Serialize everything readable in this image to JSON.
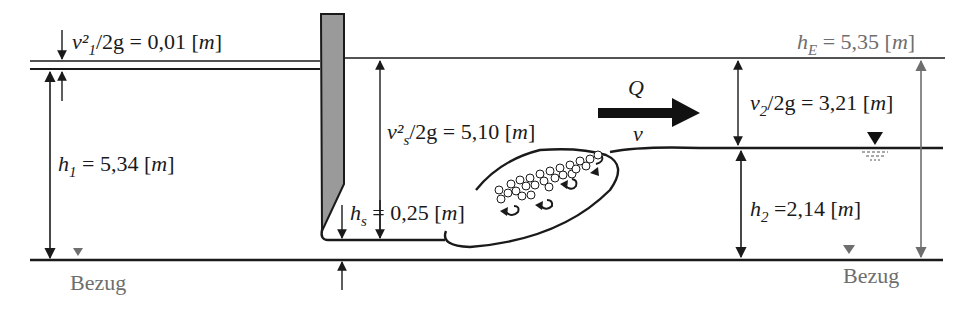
{
  "diagram": {
    "type": "hydraulic-jump-under-sluice-gate",
    "colors": {
      "line": "#1a1a1a",
      "gray": "#6e6e6e",
      "gate_fill": "#9a9a9a",
      "background": "#ffffff"
    },
    "upstream": {
      "velocity_head": {
        "symbol": "v²₁/2g",
        "value": "0,01",
        "unit": "m"
      },
      "depth": {
        "symbol": "h₁",
        "value": "5,34",
        "unit": "m"
      },
      "datum_label": "Bezug"
    },
    "gate": {
      "jet_velocity_head": {
        "symbol": "v²ₛ/2g",
        "value": "5,10",
        "unit": "m"
      },
      "jet_depth": {
        "symbol": "hₛ",
        "value": "0,25",
        "unit": "m"
      }
    },
    "flow": {
      "discharge_symbol": "Q",
      "velocity_symbol": "v"
    },
    "downstream": {
      "energy_head": {
        "symbol": "h_E",
        "value": "5,35",
        "unit": "m"
      },
      "velocity_head": {
        "symbol": "v₂/2g",
        "value": "3,21",
        "unit": "m"
      },
      "depth": {
        "symbol": "h₂",
        "value": "2,14",
        "unit": "m"
      },
      "datum_label": "Bezug"
    },
    "labels": {
      "v1": {
        "main": "v²",
        "sub": "1",
        "rest": "/2g = 0,01 [",
        "unit": "m",
        "close": "]"
      },
      "h1": {
        "main": "h",
        "sub": "1",
        "rest": " = 5,34 [",
        "unit": "m",
        "close": "]"
      },
      "vs": {
        "main": "v²",
        "sub": "s",
        "rest": "/2g = 5,10 [",
        "unit": "m",
        "close": "]"
      },
      "hs": {
        "main": "h",
        "sub": "s",
        "rest": " = 0,25 [",
        "unit": "m",
        "close": "]"
      },
      "hE": {
        "main": "h",
        "sub": "E",
        "rest": " = 5,35 [",
        "unit": "m",
        "close": "]"
      },
      "v2": {
        "main": "v",
        "sub": "2",
        "rest": "/2g = 3,21 [",
        "unit": "m",
        "close": "]"
      },
      "h2": {
        "main": "h",
        "sub": "2",
        "rest": " =2,14 [",
        "unit": "m",
        "close": "]"
      },
      "Q": "Q",
      "v": "v",
      "bezug_left": "Bezug",
      "bezug_right": "Bezug"
    }
  }
}
